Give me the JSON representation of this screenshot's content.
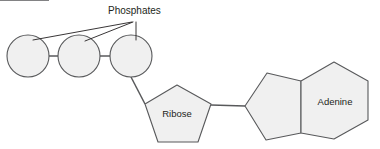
{
  "diagram": {
    "background_color": "#ffffff",
    "shape_fill_color": "#f0f0f0",
    "shape_stroke_color": "#58595b",
    "text_color": "#231f20",
    "annotation": {
      "label": "Phosphates",
      "x": 108,
      "y": 13,
      "points_to": [
        "phosphate-circle-1",
        "phosphate-circle-2",
        "phosphate-circle-3"
      ]
    },
    "phosphates": [
      {
        "name": "phosphate-circle-1",
        "cx": 28,
        "cy": 56,
        "r": 21
      },
      {
        "name": "phosphate-circle-2",
        "cx": 79,
        "cy": 56,
        "r": 21
      },
      {
        "name": "phosphate-circle-3",
        "cx": 131,
        "cy": 56,
        "r": 21
      }
    ],
    "sugar": {
      "name": "ribose-pentagon",
      "label": "Ribose",
      "label_x": 177,
      "label_y": 117,
      "points": "145,104 177,85 211,104 198,142 158,142"
    },
    "base": {
      "name": "adenine-group",
      "label": "Adenine",
      "label_x": 335,
      "label_y": 105,
      "imidazole_points": "245,106 267,73 301,81 301,133 266,140",
      "pyrimidine_points": "301,81 334,62 368,81 368,120 334,139 301,133"
    },
    "bonds": [
      {
        "name": "bond-p1-p2",
        "x1": 49,
        "y1": 56,
        "x2": 58,
        "y2": 56
      },
      {
        "name": "bond-p2-p3",
        "x1": 100,
        "y1": 56,
        "x2": 110,
        "y2": 56
      },
      {
        "name": "bond-p3-ribose",
        "x1": 131,
        "y1": 77,
        "x2": 145,
        "y2": 104
      },
      {
        "name": "bond-ribose-adenine",
        "x1": 211,
        "y1": 105,
        "x2": 245,
        "y2": 106
      }
    ],
    "leader_lines": [
      {
        "name": "leader-to-phosphate-1",
        "x1": 132,
        "y1": 22,
        "x2": 33,
        "y2": 40
      },
      {
        "name": "leader-to-phosphate-2",
        "x1": 133,
        "y1": 22,
        "x2": 85,
        "y2": 41
      },
      {
        "name": "leader-to-phosphate-3",
        "x1": 136,
        "y1": 22,
        "x2": 136,
        "y2": 40
      }
    ]
  }
}
